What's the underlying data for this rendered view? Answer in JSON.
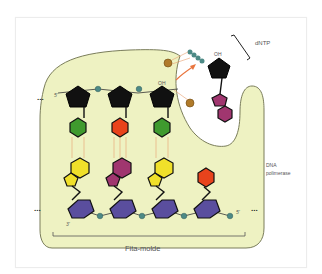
{
  "figure": {
    "labels": {
      "dntp": "dNTP",
      "dna_polymerase_line1": "DNA",
      "dna_polymerase_line2": "polimerase",
      "template_strand": "Fita-molde",
      "oh_top": "OH",
      "oh_incoming": "OH",
      "five_prime_top": "5'",
      "three_prime_bottom": "3'",
      "five_prime_bottom": "5'",
      "ellipsis": "..."
    },
    "colors": {
      "polymerase_fill": "#eef2c2",
      "polymerase_outline": "#7a7d5a",
      "sugar_top": "#111111",
      "sugar_bottom": "#5a4e9e",
      "phosphate": "#4d8a86",
      "green_base": "#3f9a2e",
      "red_base": "#e8431c",
      "yellow_base": "#f0e02a",
      "magenta_base": "#a0366f",
      "catalytic_ion": "#b07a2a",
      "arrow": "#e9753e",
      "h_bond": "#e8a070"
    },
    "new_strand_pairs": [
      {
        "top_base": "green",
        "bottom_base": "yellow"
      },
      {
        "top_base": "red",
        "bottom_base": "magenta"
      },
      {
        "top_base": "green",
        "bottom_base": "yellow"
      },
      {
        "top_base": "none",
        "bottom_base": "red"
      }
    ],
    "incoming_nucleotide": {
      "base": "magenta",
      "phosphates": 3
    }
  }
}
